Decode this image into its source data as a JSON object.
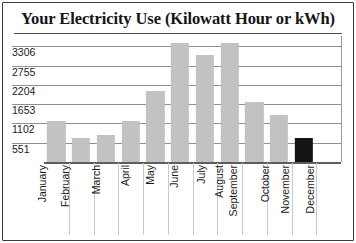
{
  "chart_title": "Your Electricity Use (Kilowatt Hour or kWh)",
  "axis": {
    "y_ticks": [
      "3306",
      "2755",
      "2204",
      "1653",
      "1102",
      "551"
    ],
    "y_tick_values": [
      3306,
      2755,
      2204,
      1653,
      1102,
      551
    ]
  },
  "months": [
    "January",
    "February",
    "March",
    "April",
    "May",
    "June",
    "July",
    "August",
    "September",
    "October",
    "November",
    "December"
  ],
  "colors": {
    "bar": "#c2c2c2",
    "highlight_bar": "#141414",
    "gridline": "#8e8e8e",
    "axis": "#5d5d5d",
    "text": "#1b1b1b",
    "frame": "#3a3a3a",
    "background": "#ffffff"
  },
  "chart_data": {
    "type": "bar",
    "title": "Your Electricity Use (Kilowatt Hour or kWh)",
    "xlabel": "",
    "ylabel": "",
    "categories": [
      "January",
      "February",
      "March",
      "April",
      "May",
      "June",
      "July",
      "August",
      "September",
      "October",
      "November",
      "December"
    ],
    "values": [
      1180,
      700,
      760,
      1180,
      2020,
      3400,
      3050,
      3400,
      1720,
      1350,
      700,
      0
    ],
    "ylim": [
      0,
      3600
    ],
    "yticks": [
      551,
      1102,
      1653,
      2204,
      2755,
      3306
    ],
    "grid": true,
    "legend": false,
    "highlight_category": "November"
  }
}
